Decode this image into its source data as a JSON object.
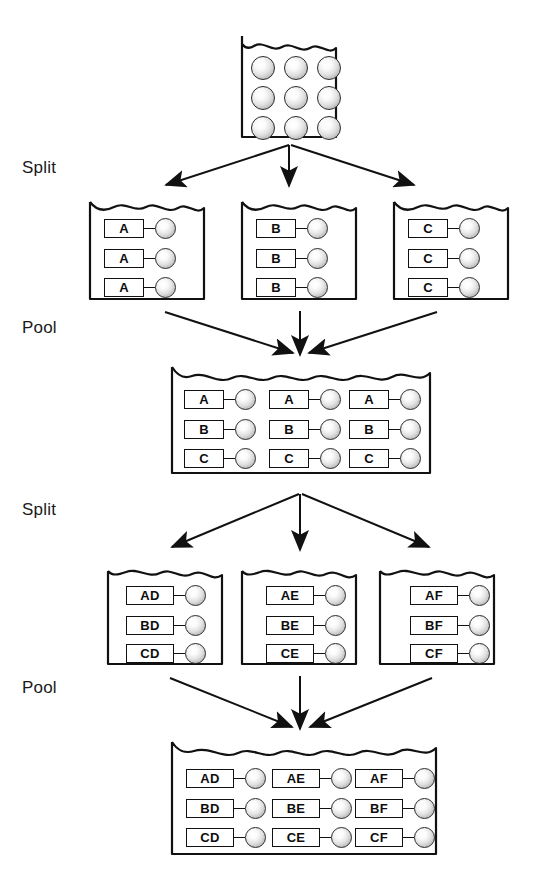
{
  "diagram": {
    "width": 553,
    "height": 893,
    "line_color": "#111111",
    "bead_color": "#d8d8d8",
    "background": "#ffffff"
  },
  "stage_labels": [
    {
      "id": "split-1",
      "text": "Split",
      "x": 22,
      "y": 158
    },
    {
      "id": "pool-1",
      "text": "Pool",
      "x": 22,
      "y": 318
    },
    {
      "id": "split-2",
      "text": "Split",
      "x": 22,
      "y": 500
    },
    {
      "id": "pool-2",
      "text": "Pool",
      "x": 22,
      "y": 678
    }
  ],
  "vessels": [
    {
      "id": "starting-vessel",
      "kind": "beads-only",
      "x": 240,
      "y": 34,
      "w": 98,
      "h": 105,
      "columns": 3,
      "rows": 3,
      "beads": [
        [
          "bead",
          "bead",
          "bead"
        ],
        [
          "bead",
          "bead",
          "bead"
        ],
        [
          "bead",
          "bead",
          "bead"
        ]
      ]
    },
    {
      "id": "split1-vessel-a",
      "kind": "tagged",
      "x": 88,
      "y": 196,
      "w": 118,
      "h": 105,
      "rows": [
        [
          "A"
        ],
        [
          "A"
        ],
        [
          "A"
        ]
      ]
    },
    {
      "id": "split1-vessel-b",
      "kind": "tagged",
      "x": 240,
      "y": 196,
      "w": 118,
      "h": 105,
      "rows": [
        [
          "B"
        ],
        [
          "B"
        ],
        [
          "B"
        ]
      ]
    },
    {
      "id": "split1-vessel-c",
      "kind": "tagged",
      "x": 392,
      "y": 196,
      "w": 118,
      "h": 105,
      "rows": [
        [
          "C"
        ],
        [
          "C"
        ],
        [
          "C"
        ]
      ]
    },
    {
      "id": "pool1-vessel",
      "kind": "tagged-grid",
      "x": 170,
      "y": 363,
      "w": 262,
      "h": 112,
      "rows": [
        [
          "A",
          "A",
          "A"
        ],
        [
          "B",
          "B",
          "B"
        ],
        [
          "C",
          "C",
          "C"
        ]
      ]
    },
    {
      "id": "split2-vessel-d",
      "kind": "tagged",
      "x": 106,
      "y": 561,
      "w": 118,
      "h": 105,
      "rows": [
        [
          "AD"
        ],
        [
          "BD"
        ],
        [
          "CD"
        ]
      ]
    },
    {
      "id": "split2-vessel-e",
      "kind": "tagged",
      "x": 240,
      "y": 561,
      "w": 118,
      "h": 105,
      "rows": [
        [
          "AE"
        ],
        [
          "BE"
        ],
        [
          "CE"
        ]
      ]
    },
    {
      "id": "split2-vessel-f",
      "kind": "tagged",
      "x": 378,
      "y": 561,
      "w": 118,
      "h": 105,
      "rows": [
        [
          "AF"
        ],
        [
          "BF"
        ],
        [
          "CF"
        ]
      ]
    },
    {
      "id": "pool2-vessel",
      "kind": "tagged-grid",
      "x": 170,
      "y": 738,
      "w": 268,
      "h": 118,
      "rows": [
        [
          "AD",
          "AE",
          "AF"
        ],
        [
          "BD",
          "BE",
          "BF"
        ],
        [
          "CD",
          "CE",
          "CF"
        ]
      ]
    }
  ],
  "arrow_groups": [
    {
      "id": "split-1-arrows",
      "direction": "diverge",
      "origin_x": 289,
      "origin_y": 145,
      "targets": [
        {
          "x": 160,
          "y": 187
        },
        {
          "x": 289,
          "y": 187
        },
        {
          "x": 418,
          "y": 187
        }
      ]
    },
    {
      "id": "pool-1-arrows",
      "direction": "converge",
      "target_x": 300,
      "target_y": 356,
      "origins": [
        {
          "x": 163,
          "y": 311
        },
        {
          "x": 300,
          "y": 311
        },
        {
          "x": 437,
          "y": 311
        }
      ]
    },
    {
      "id": "split-2-arrows",
      "direction": "diverge",
      "origin_x": 300,
      "origin_y": 494,
      "targets": [
        {
          "x": 168,
          "y": 550
        },
        {
          "x": 300,
          "y": 550
        },
        {
          "x": 432,
          "y": 550
        }
      ]
    },
    {
      "id": "pool-2-arrows",
      "direction": "converge",
      "target_x": 300,
      "target_y": 730,
      "origins": [
        {
          "x": 168,
          "y": 678
        },
        {
          "x": 300,
          "y": 678
        },
        {
          "x": 432,
          "y": 678
        }
      ]
    }
  ]
}
